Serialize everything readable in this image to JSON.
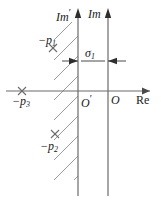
{
  "figure": {
    "colors": {
      "axis": "#6b6b6b",
      "hatch": "#9a9a9a",
      "text": "#1a1a1a",
      "background": "#ffffff"
    }
  },
  "axes": {
    "imaginary_shifted": {
      "label": "Im",
      "prime": "′",
      "x_px": 78,
      "origin_label": "O",
      "origin_prime": "′"
    },
    "imaginary": {
      "label": "Im",
      "x_px": 108,
      "origin_label": "O"
    },
    "real": {
      "label": "Re",
      "y_px": 91
    }
  },
  "dimension": {
    "label": "σ",
    "subscript": "1",
    "from_x_px": 78,
    "to_x_px": 108,
    "y_px": 61
  },
  "poles": [
    {
      "id": "p1",
      "marker": "×",
      "label_prefix": "−p",
      "subscript": "1",
      "x_px": 53,
      "y_px": 48
    },
    {
      "id": "p2",
      "marker": "×",
      "label_prefix": "−p",
      "subscript": "2",
      "x_px": 55,
      "y_px": 134
    },
    {
      "id": "p3",
      "marker": "×",
      "label_prefix": "−p",
      "subscript": "3",
      "x_px": 22,
      "y_px": 91
    }
  ],
  "hatching": {
    "region": "left-of-shifted-imaginary-axis",
    "direction": "lower-left-to-upper-right",
    "x_right_px": 78
  }
}
